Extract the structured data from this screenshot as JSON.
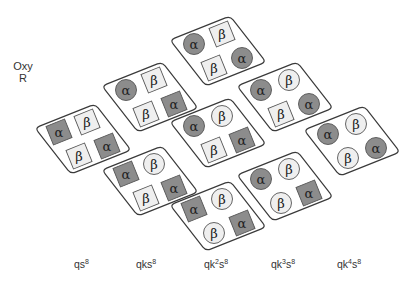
{
  "side_label": {
    "line1": "Oxy",
    "line2": "R"
  },
  "colors": {
    "alpha_fill": "#8c8c8c",
    "beta_fill": "#efefef",
    "outline": "#3a3a3a",
    "text": "#222222"
  },
  "symbols": {
    "alpha": "α",
    "beta": "β"
  },
  "columns": [
    {
      "label_base": "qk",
      "label_k_exp": "",
      "label_s": "s",
      "label_s_exp": "8",
      "display": "qs8",
      "x": 88
    },
    {
      "label_base": "qks",
      "label_k_exp": "",
      "label_s": "",
      "label_s_exp": "8",
      "display": "qks8",
      "x": 150
    },
    {
      "label_base": "qk",
      "label_k_exp": "2",
      "label_s": "s",
      "label_s_exp": "8",
      "display": "qk2s8",
      "x": 218
    },
    {
      "label_base": "qk",
      "label_k_exp": "3",
      "label_s": "s",
      "label_s_exp": "8",
      "display": "qk3s8",
      "x": 285
    },
    {
      "label_base": "qk",
      "label_k_exp": "4",
      "label_s": "s",
      "label_s_exp": "8",
      "display": "qk4s8",
      "x": 351
    }
  ],
  "panels": [
    {
      "column": 0,
      "cx": 83,
      "cy": 138,
      "subunits": [
        {
          "type": "alpha",
          "shape": "square",
          "pos": "left"
        },
        {
          "type": "beta",
          "shape": "square",
          "pos": "top"
        },
        {
          "type": "beta",
          "shape": "square",
          "pos": "bottom"
        },
        {
          "type": "alpha",
          "shape": "square",
          "pos": "right"
        }
      ]
    },
    {
      "column": 1,
      "cx": 150,
      "cy": 96,
      "subunits": [
        {
          "type": "alpha",
          "shape": "circle",
          "pos": "left"
        },
        {
          "type": "beta",
          "shape": "square",
          "pos": "top"
        },
        {
          "type": "beta",
          "shape": "square",
          "pos": "bottom"
        },
        {
          "type": "alpha",
          "shape": "square",
          "pos": "right"
        }
      ]
    },
    {
      "column": 1,
      "cx": 150,
      "cy": 180,
      "subunits": [
        {
          "type": "alpha",
          "shape": "square",
          "pos": "left"
        },
        {
          "type": "beta",
          "shape": "circle",
          "pos": "top"
        },
        {
          "type": "beta",
          "shape": "square",
          "pos": "bottom"
        },
        {
          "type": "alpha",
          "shape": "square",
          "pos": "right"
        }
      ]
    },
    {
      "column": 2,
      "cx": 218,
      "cy": 50,
      "subunits": [
        {
          "type": "alpha",
          "shape": "circle",
          "pos": "left"
        },
        {
          "type": "beta",
          "shape": "square",
          "pos": "top"
        },
        {
          "type": "beta",
          "shape": "square",
          "pos": "bottom"
        },
        {
          "type": "alpha",
          "shape": "circle",
          "pos": "right"
        }
      ]
    },
    {
      "column": 2,
      "cx": 218,
      "cy": 132,
      "subunits": [
        {
          "type": "alpha",
          "shape": "circle",
          "pos": "left"
        },
        {
          "type": "beta",
          "shape": "circle",
          "pos": "top"
        },
        {
          "type": "beta",
          "shape": "square",
          "pos": "bottom"
        },
        {
          "type": "alpha",
          "shape": "square",
          "pos": "right"
        }
      ]
    },
    {
      "column": 2,
      "cx": 218,
      "cy": 215,
      "subunits": [
        {
          "type": "alpha",
          "shape": "square",
          "pos": "left"
        },
        {
          "type": "beta",
          "shape": "circle",
          "pos": "top"
        },
        {
          "type": "beta",
          "shape": "circle",
          "pos": "bottom"
        },
        {
          "type": "alpha",
          "shape": "square",
          "pos": "right"
        }
      ]
    },
    {
      "column": 3,
      "cx": 285,
      "cy": 96,
      "subunits": [
        {
          "type": "alpha",
          "shape": "circle",
          "pos": "left"
        },
        {
          "type": "beta",
          "shape": "circle",
          "pos": "top"
        },
        {
          "type": "beta",
          "shape": "square",
          "pos": "bottom"
        },
        {
          "type": "alpha",
          "shape": "circle",
          "pos": "right"
        }
      ]
    },
    {
      "column": 3,
      "cx": 285,
      "cy": 185,
      "subunits": [
        {
          "type": "alpha",
          "shape": "circle",
          "pos": "left"
        },
        {
          "type": "beta",
          "shape": "circle",
          "pos": "top"
        },
        {
          "type": "beta",
          "shape": "circle",
          "pos": "bottom"
        },
        {
          "type": "alpha",
          "shape": "square",
          "pos": "right"
        }
      ]
    },
    {
      "column": 4,
      "cx": 352,
      "cy": 140,
      "subunits": [
        {
          "type": "alpha",
          "shape": "circle",
          "pos": "left"
        },
        {
          "type": "beta",
          "shape": "circle",
          "pos": "top"
        },
        {
          "type": "beta",
          "shape": "circle",
          "pos": "bottom"
        },
        {
          "type": "alpha",
          "shape": "circle",
          "pos": "right"
        }
      ]
    }
  ]
}
